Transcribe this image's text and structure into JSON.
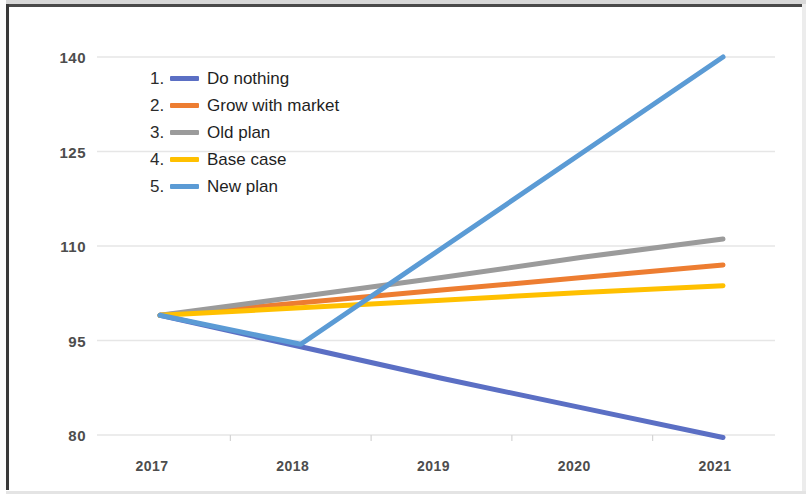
{
  "chart_data": {
    "type": "line",
    "title": "",
    "xlabel": "",
    "ylabel": "",
    "x": [
      2017,
      2018,
      2019,
      2020,
      2021
    ],
    "xtick_labels": [
      "2017",
      "2018",
      "2019",
      "2020",
      "2021"
    ],
    "ytick_labels": [
      "140",
      "125",
      "110",
      "95",
      "80"
    ],
    "yticks": [
      140,
      125,
      110,
      95,
      80
    ],
    "ylim": [
      80,
      140
    ],
    "xlim": [
      2017,
      2021
    ],
    "grid": "horizontal",
    "legend_position": "upper-left-inside",
    "series": [
      {
        "name": "Do nothing",
        "index": "1.",
        "color": "#5B6FC4",
        "values": [
          99.0,
          94.0,
          89.0,
          84.3,
          79.6
        ]
      },
      {
        "name": "Grow with market",
        "index": "2.",
        "color": "#ED7D31",
        "values": [
          99.0,
          101.0,
          103.0,
          105.0,
          107.0
        ]
      },
      {
        "name": "Old plan",
        "index": "3.",
        "color": "#9B9B9B",
        "values": [
          99.0,
          102.0,
          105.0,
          108.2,
          111.1
        ]
      },
      {
        "name": "Base case",
        "index": "4.",
        "color": "#FFC000",
        "values": [
          99.0,
          100.2,
          101.4,
          102.6,
          103.7
        ]
      },
      {
        "name": "New plan",
        "index": "5.",
        "color": "#5B9BD5",
        "values": [
          99.0,
          94.4,
          109.6,
          124.8,
          140.0
        ]
      }
    ]
  },
  "colors": {
    "axis_text": "#4d4d4d",
    "gridline": "#e6e6e6",
    "background": "#ffffff",
    "frame": "#3a3a3a"
  }
}
